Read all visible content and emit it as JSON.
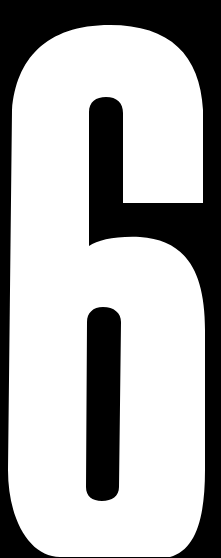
{
  "image": {
    "glyph": "6",
    "description": "Large white condensed numeral six on a black background",
    "colors": {
      "background": "#000000",
      "glyph": "#ffffff"
    }
  }
}
